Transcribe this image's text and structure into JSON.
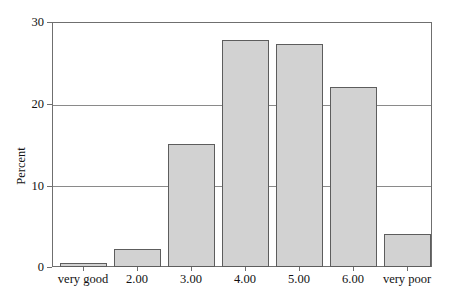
{
  "chart_data": {
    "type": "bar",
    "title": "",
    "subtitle": "",
    "xlabel": "",
    "ylabel": "Percent",
    "categories": [
      "very good",
      "2.00",
      "3.00",
      "4.00",
      "5.00",
      "6.00",
      "very poor"
    ],
    "values": [
      0.5,
      2.2,
      15.0,
      27.8,
      27.3,
      22.0,
      4.0
    ],
    "series": [
      {
        "name": "Percent",
        "values": [
          0.5,
          2.2,
          15.0,
          27.8,
          27.3,
          22.0,
          4.0
        ]
      }
    ],
    "ylim": [
      0,
      30
    ],
    "yticks": [
      0,
      10,
      20,
      30
    ],
    "ytick_labels": [
      "0",
      "10",
      "20",
      "30"
    ],
    "grid": "horizontal",
    "legend": "none",
    "bar_fill_color": "#d2d2d2",
    "bar_border_color": "#5d5d5d",
    "axis_color": "#6f6f6f",
    "gridline_color": "#8a8a8a",
    "background_color": "#ffffff",
    "text_color": "#111111"
  }
}
